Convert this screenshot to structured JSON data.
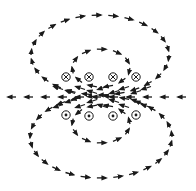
{
  "diagram": {
    "kind": "magnetic-field-lines-solenoid-cross-section",
    "colors": {
      "ink": "#1a1a1a",
      "background": "#ffffff"
    },
    "conductors_into_page": [
      {
        "x": 66,
        "y": 77
      },
      {
        "x": 89,
        "y": 77
      },
      {
        "x": 113,
        "y": 77
      },
      {
        "x": 136,
        "y": 77
      }
    ],
    "conductors_out_of_page": [
      {
        "x": 66,
        "y": 115
      },
      {
        "x": 89,
        "y": 116
      },
      {
        "x": 113,
        "y": 116
      },
      {
        "x": 136,
        "y": 115
      }
    ],
    "field_direction_on_axis": "left",
    "loops": [
      {
        "name": "outer-top",
        "cx": 100,
        "cy": 55,
        "rx": 69,
        "ry": 40,
        "direction": "clockwise"
      },
      {
        "name": "inner-top",
        "cx": 101,
        "cy": 68,
        "rx": 29,
        "ry": 19,
        "direction": "clockwise"
      },
      {
        "name": "inner-bottom",
        "cx": 101,
        "cy": 124,
        "rx": 29,
        "ry": 19,
        "direction": "counterclockwise"
      },
      {
        "name": "outer-bottom",
        "cx": 101,
        "cy": 137,
        "rx": 71,
        "ry": 41,
        "direction": "counterclockwise"
      }
    ]
  }
}
